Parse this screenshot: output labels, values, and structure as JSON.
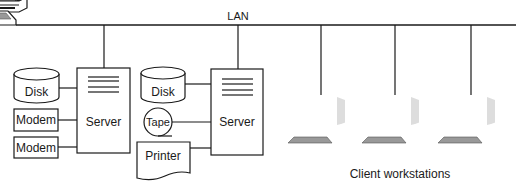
{
  "diagram": {
    "title": "LAN",
    "lan_label": "LAN",
    "servers": [
      {
        "label": "Server",
        "peripherals": [
          {
            "type": "disk",
            "label": "Disk"
          },
          {
            "type": "modem",
            "label": "Modem"
          },
          {
            "type": "modem",
            "label": "Modem"
          }
        ]
      },
      {
        "label": "Server",
        "peripherals": [
          {
            "type": "disk",
            "label": "Disk"
          },
          {
            "type": "tape",
            "label": "Tape"
          },
          {
            "type": "printer",
            "label": "Printer"
          }
        ]
      }
    ],
    "workstations": {
      "count": 3,
      "label": "Client workstations"
    },
    "colors": {
      "stroke": "#1a1a1a",
      "background": "#ffffff"
    }
  }
}
